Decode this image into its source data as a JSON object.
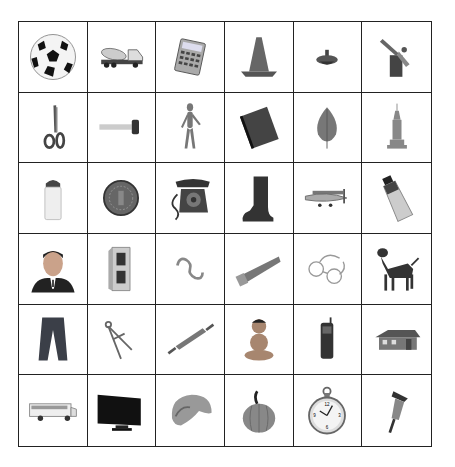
{
  "grid": {
    "rows": 6,
    "columns": 6,
    "items": [
      {
        "label": "soccer ball",
        "icon": "soccer-ball-icon"
      },
      {
        "label": "cement mixer truck",
        "icon": "cement-truck-icon"
      },
      {
        "label": "calculator",
        "icon": "calculator-icon"
      },
      {
        "label": "traffic cone",
        "icon": "traffic-cone-icon"
      },
      {
        "label": "spinning top",
        "icon": "spinning-top-icon"
      },
      {
        "label": "blowtorch",
        "icon": "blowtorch-icon"
      },
      {
        "label": "scissors",
        "icon": "scissors-icon"
      },
      {
        "label": "test tube brush",
        "icon": "brush-icon"
      },
      {
        "label": "wooden mannequin",
        "icon": "mannequin-icon"
      },
      {
        "label": "notebook",
        "icon": "notebook-icon"
      },
      {
        "label": "leaf",
        "icon": "leaf-icon"
      },
      {
        "label": "skyscraper",
        "icon": "skyscraper-icon"
      },
      {
        "label": "salt shaker",
        "icon": "salt-shaker-icon"
      },
      {
        "label": "coin",
        "icon": "coin-icon"
      },
      {
        "label": "rotary telephone",
        "icon": "telephone-icon"
      },
      {
        "label": "boot",
        "icon": "boot-icon"
      },
      {
        "label": "airplane",
        "icon": "airplane-icon"
      },
      {
        "label": "paint tube",
        "icon": "paint-tube-icon"
      },
      {
        "label": "man",
        "icon": "man-portrait-icon"
      },
      {
        "label": "cinder block",
        "icon": "cinder-block-icon"
      },
      {
        "label": "S hook",
        "icon": "s-hook-icon"
      },
      {
        "label": "saw",
        "icon": "saw-icon"
      },
      {
        "label": "eyeglasses",
        "icon": "eyeglasses-icon"
      },
      {
        "label": "dog",
        "icon": "dog-icon"
      },
      {
        "label": "jeans",
        "icon": "jeans-icon"
      },
      {
        "label": "compass",
        "icon": "drafting-compass-icon"
      },
      {
        "label": "rolling pin",
        "icon": "rolling-pin-icon"
      },
      {
        "label": "baby",
        "icon": "baby-icon"
      },
      {
        "label": "cell phone",
        "icon": "cell-phone-icon"
      },
      {
        "label": "house",
        "icon": "house-icon"
      },
      {
        "label": "school bus",
        "icon": "school-bus-icon"
      },
      {
        "label": "television",
        "icon": "television-icon"
      },
      {
        "label": "nautilus shell",
        "icon": "shell-icon"
      },
      {
        "label": "pumpkin",
        "icon": "pumpkin-icon"
      },
      {
        "label": "pocket watch",
        "icon": "pocket-watch-icon"
      },
      {
        "label": "jackhammer",
        "icon": "jackhammer-icon"
      }
    ]
  }
}
